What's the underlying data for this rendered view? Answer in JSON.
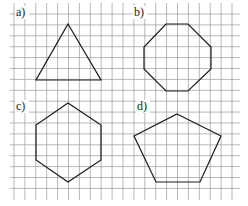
{
  "figure": {
    "grid": {
      "x_start": 3,
      "x_end": 240,
      "y_start": 3,
      "y_end": 200,
      "pitch": 10.9,
      "first_v_line": 14,
      "first_h_line": 14,
      "line_color": "#9a9a9a"
    },
    "panels": [
      {
        "id": "a",
        "label": "a)",
        "label_pos": [
          16,
          16
        ],
        "shape": "triangle",
        "points": [
          [
            68,
            24
          ],
          [
            101,
            80
          ],
          [
            36,
            80
          ]
        ]
      },
      {
        "id": "b",
        "label": "b)",
        "label_pos": [
          134,
          16
        ],
        "shape": "octagon",
        "points": [
          [
            166,
            24
          ],
          [
            188,
            24
          ],
          [
            211,
            47
          ],
          [
            211,
            69
          ],
          [
            188,
            91
          ],
          [
            166,
            91
          ],
          [
            144,
            69
          ],
          [
            144,
            47
          ]
        ]
      },
      {
        "id": "c",
        "label": "c)",
        "label_pos": [
          16,
          110
        ],
        "shape": "hexagon",
        "points": [
          [
            68,
            103
          ],
          [
            101,
            125
          ],
          [
            101,
            160
          ],
          [
            68,
            182
          ],
          [
            36,
            160
          ],
          [
            36,
            125
          ]
        ]
      },
      {
        "id": "d",
        "label": "d)",
        "label_pos": [
          137,
          110
        ],
        "shape": "pentagon",
        "points": [
          [
            177,
            114
          ],
          [
            221,
            136
          ],
          [
            200,
            182
          ],
          [
            156,
            182
          ],
          [
            134,
            136
          ]
        ]
      }
    ],
    "stroke_color": "#1a1a1a"
  }
}
